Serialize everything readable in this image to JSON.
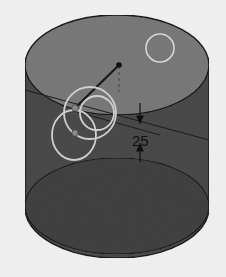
{
  "diagram": {
    "type": "3d-cylinder-sketch",
    "dimension_label": "25",
    "colors": {
      "background": "#eeeeee",
      "top_face": "#7a7a7a",
      "body": "#4a4a4a",
      "bottom_face": "#3c3c3c",
      "outline": "#1a1a1a",
      "highlight_circle": "#d0d0d0"
    }
  }
}
